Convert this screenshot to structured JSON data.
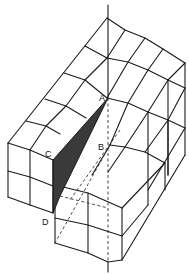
{
  "figure": {
    "fill_color": "#3a3a3a",
    "line_color": "#1a1a1a",
    "labels": {
      "A": "A",
      "B": "B",
      "C": "C",
      "D": "D"
    }
  }
}
